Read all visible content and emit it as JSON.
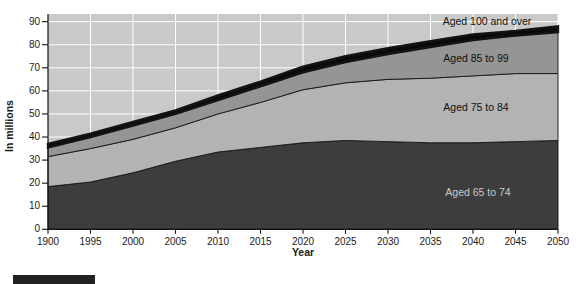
{
  "figure": {
    "y_axis_title": "In millions",
    "x_axis_title": "Year",
    "labels": {
      "aged_100": "Aged 100 and over",
      "aged_85": "Aged 85 to 99",
      "aged_75": "Aged 75 to 84",
      "aged_65": "Aged 65 to 74"
    }
  },
  "colors": {
    "page_bg": "#ffffff",
    "plot_bg": "#c9c9c9",
    "gridline": "#ffffff",
    "axis": "#111111",
    "area_65_74": "#3d3d3d",
    "area_75_84": "#b3b3b3",
    "area_85_99": "#959595",
    "area_100_plus": "#0a0a0a",
    "label_on_dark": "#c9c9c9",
    "figure_bar": "#222222"
  },
  "chart_data": {
    "type": "area",
    "stacked": true,
    "xlabel": "Year",
    "ylabel": "In millions",
    "ylim": [
      0,
      90
    ],
    "grid": true,
    "legend_position": "labels-on-areas",
    "categories": [
      "1900",
      "1995",
      "2000",
      "2005",
      "2010",
      "2015",
      "2020",
      "2025",
      "2030",
      "2035",
      "2040",
      "2045",
      "2050"
    ],
    "yticks": [
      "0",
      "10",
      "20",
      "30",
      "40",
      "50",
      "60",
      "70",
      "80",
      "90"
    ],
    "series": [
      {
        "name": "Aged 65 to 74",
        "color": "#3d3d3d",
        "values": [
          18.5,
          20.5,
          24.5,
          29.5,
          33.5,
          35.5,
          37.5,
          38.5,
          38.0,
          37.5,
          37.5,
          38.0,
          38.5
        ]
      },
      {
        "name": "Aged 75 to 84",
        "color": "#b3b3b3",
        "values": [
          13.0,
          14.5,
          14.5,
          14.5,
          16.5,
          19.5,
          23.0,
          25.0,
          27.0,
          28.0,
          29.0,
          29.5,
          29.0
        ]
      },
      {
        "name": "Aged 85 to 99",
        "color": "#959595",
        "values": [
          4.0,
          5.0,
          6.0,
          6.0,
          6.0,
          7.0,
          7.5,
          9.0,
          11.0,
          13.5,
          15.5,
          16.5,
          18.0
        ]
      },
      {
        "name": "Aged 100 and over",
        "color": "#0a0a0a",
        "values": [
          1.5,
          1.5,
          1.5,
          1.5,
          2.0,
          2.0,
          2.5,
          2.5,
          2.5,
          2.5,
          2.5,
          2.0,
          2.5
        ]
      }
    ],
    "cumulative_totals": [
      37.0,
      41.5,
      46.5,
      51.5,
      58.0,
      64.0,
      70.5,
      75.0,
      78.5,
      81.5,
      84.5,
      86.0,
      88.0
    ]
  }
}
